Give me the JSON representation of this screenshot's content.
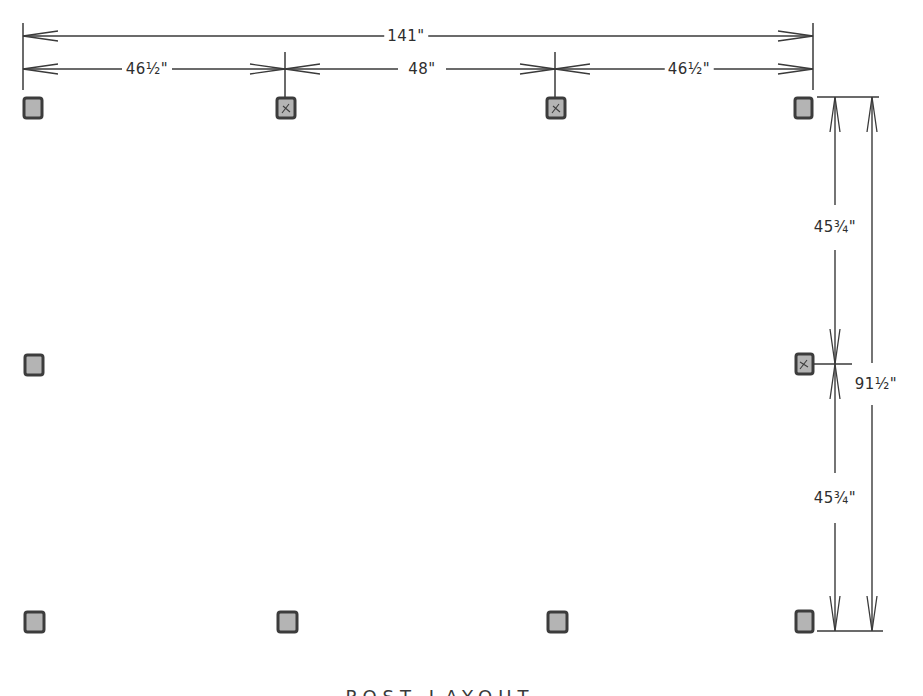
{
  "drawing": {
    "type": "post layout plan",
    "units": "inches",
    "colors": {
      "line": "#3a3a3a",
      "post_fill": "#b4b4b4",
      "post_border": "#3c3c3c",
      "background": "#ffffff"
    }
  },
  "dimensions": {
    "overall_width": {
      "label": "141\"",
      "value_in": 141
    },
    "bay_left": {
      "label": "46½\"",
      "value_in": 46.5
    },
    "bay_center": {
      "label": "48\"",
      "value_in": 48
    },
    "bay_right": {
      "label": "46½\"",
      "value_in": 46.5
    },
    "overall_depth": {
      "label": "91½\"",
      "value_in": 91.5
    },
    "depth_upper": {
      "label": "45¾\"",
      "value_in": 45.75
    },
    "depth_lower": {
      "label": "45¾\"",
      "value_in": 45.75
    }
  },
  "posts": {
    "count": 10,
    "rows": [
      {
        "row": "front",
        "count": 4,
        "marked": [
          false,
          true,
          true,
          false
        ]
      },
      {
        "row": "middle",
        "count": 2,
        "marked": [
          false,
          true
        ]
      },
      {
        "row": "back",
        "count": 4,
        "marked": [
          false,
          false,
          false,
          false
        ]
      }
    ]
  },
  "caption": {
    "text": "POST LAYOUT",
    "partially_visible": true
  }
}
